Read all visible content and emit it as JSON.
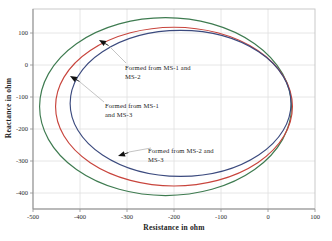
{
  "figure": {
    "width": 332,
    "height": 241,
    "background": "#ffffff"
  },
  "chart_data": {
    "type": "line",
    "subtype": "impedance-ellipse-loci",
    "title": "",
    "xlabel": "Resistance in ohm",
    "ylabel": "Reactance in ohm",
    "xlim": [
      -500,
      100
    ],
    "ylim": [
      -450,
      175
    ],
    "x_ticks": [
      -500,
      -400,
      -300,
      -200,
      -100,
      0,
      100
    ],
    "y_ticks": [
      100,
      0,
      -100,
      -200,
      -300,
      -400
    ],
    "grid": true,
    "legend": "none",
    "series": [
      {
        "name": "outer-ellipse",
        "shape": "ellipse",
        "center": [
          -218,
          -130
        ],
        "rx": 268,
        "ry": 278,
        "color": "#3e7b50"
      },
      {
        "name": "middle-ellipse",
        "shape": "ellipse",
        "center": [
          -200,
          -130
        ],
        "rx": 252,
        "ry": 248,
        "color": "#c8443c"
      },
      {
        "name": "inner-ellipse",
        "shape": "ellipse",
        "center": [
          -186,
          -120
        ],
        "rx": 235,
        "ry": 228,
        "color": "#3b4a7e"
      }
    ],
    "annotations": [
      {
        "lines": [
          "Formed from MS-1 and",
          "MS-2"
        ],
        "text_px": [
          125,
          70
        ],
        "arrow_tip_px": [
          99,
          40
        ],
        "arrow_angle_deg": 210,
        "leader_px": [
          [
            109,
            46
          ],
          [
            126,
            63
          ]
        ]
      },
      {
        "lines": [
          "Formed from MS-1",
          "and MS-3"
        ],
        "text_px": [
          105,
          108
        ],
        "arrow_tip_px": [
          70,
          76
        ],
        "arrow_angle_deg": 210,
        "leader_px": [
          [
            80,
            82
          ],
          [
            104,
            102
          ]
        ]
      },
      {
        "lines": [
          "Formed from MS-2 and",
          "MS-3"
        ],
        "text_px": [
          148,
          153
        ],
        "arrow_tip_px": [
          118,
          156
        ],
        "arrow_angle_deg": 162,
        "leader_px": [
          [
            129,
            152
          ],
          [
            151,
            148
          ]
        ]
      }
    ],
    "layout_px": {
      "plot_left": 33,
      "plot_top": 9,
      "plot_width": 282,
      "plot_height": 200
    },
    "colors": {
      "frame": "#c4c4c4",
      "axis": "#8f8f8f",
      "grid": "#e0e0e0",
      "tick": "#8f8f8f",
      "tick_text": "#2b2b2b",
      "annotation_text": "#1c1c1c",
      "leader": "#b5b5b5",
      "arrow": "#111111"
    }
  }
}
